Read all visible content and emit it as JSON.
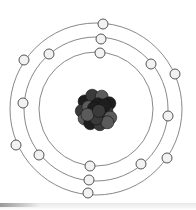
{
  "diagram": {
    "title": "",
    "center": {
      "x": 96,
      "y": 109
    },
    "colors": {
      "orbit": "#7a7a7a",
      "electron_fill": "#f2f2f2",
      "electron_stroke": "#555555",
      "nucleus_dark": "#1e1e1e",
      "nucleus_mid": "#3a3a3a",
      "nucleus_light": "#5a5a5a"
    },
    "nucleus": {
      "radius": 20
    },
    "shells": [
      {
        "name": "shell-1",
        "radius": 57,
        "electron_count": 2,
        "electrons": [
          [
            100,
            53
          ],
          [
            90,
            166
          ]
        ]
      },
      {
        "name": "shell-2",
        "radius": 72,
        "electron_count": 8,
        "electrons": [
          [
            101,
            39
          ],
          [
            49,
            54
          ],
          [
            151,
            64
          ],
          [
            23,
            103
          ],
          [
            168,
            116
          ],
          [
            39,
            155
          ],
          [
            141,
            164
          ],
          [
            89,
            180
          ]
        ]
      },
      {
        "name": "shell-3",
        "radius": 86,
        "electron_count": 6,
        "electrons": [
          [
            103,
            24
          ],
          [
            24,
            60
          ],
          [
            175,
            74
          ],
          [
            16,
            145
          ],
          [
            167,
            158
          ],
          [
            88,
            193
          ]
        ]
      }
    ],
    "total_electrons": 16
  }
}
